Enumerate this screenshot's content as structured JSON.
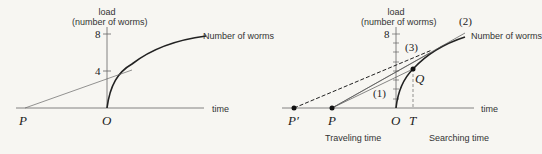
{
  "left_panel": {
    "y_axis_label_line1": "load",
    "y_axis_label_line2": "(number of worms)",
    "tick_8": "8",
    "tick_4": "4",
    "x_axis_label": "time",
    "curve_label": "Number of worms",
    "point_P": "P",
    "point_O": "O"
  },
  "right_panel": {
    "y_axis_label_line1": "load",
    "y_axis_label_line2": "(number of worms)",
    "tick_8": "8",
    "x_axis_label": "time",
    "curve_label": "Number of worms",
    "point_P_prime": "P′",
    "point_P": "P",
    "point_O": "O",
    "point_T": "T",
    "point_Q": "Q",
    "line_1": "(1)",
    "line_2": "(2)",
    "line_3": "(3)",
    "traveling_label": "Traveling time",
    "searching_label": "Searching time"
  },
  "colors": {
    "line": "#222222",
    "thin_line": "#555555",
    "background": "#f7f6f2"
  }
}
